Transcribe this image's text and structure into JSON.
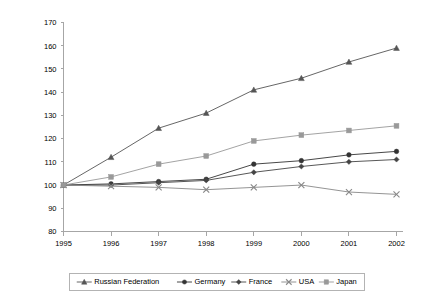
{
  "chart_data": {
    "type": "line",
    "title": "",
    "xlabel": "",
    "ylabel": "",
    "x": [
      1995,
      1996,
      1997,
      1998,
      1999,
      2000,
      2001,
      2002
    ],
    "categories": [
      "1995",
      "1996",
      "1997",
      "1998",
      "1999",
      "2000",
      "2001",
      "2002"
    ],
    "ylim": [
      80,
      170
    ],
    "yticks": [
      80,
      90,
      100,
      110,
      120,
      130,
      140,
      150,
      160,
      170
    ],
    "ytick_labels": [
      "80",
      "90",
      "100",
      "110",
      "120",
      "130",
      "140",
      "150",
      "160",
      "170"
    ],
    "grid": false,
    "legend_position": "bottom",
    "series": [
      {
        "name": "Russian Federation",
        "marker": "triangle",
        "color": "#555555",
        "values": [
          100,
          112,
          124.5,
          131,
          141,
          146,
          153,
          159
        ]
      },
      {
        "name": "Germany",
        "marker": "circle",
        "color": "#333333",
        "values": [
          100,
          100.5,
          101.5,
          102.5,
          109,
          110.5,
          113,
          114.5
        ]
      },
      {
        "name": "France",
        "marker": "diamond",
        "color": "#444444",
        "values": [
          100,
          100,
          101,
          102,
          105.5,
          108,
          110,
          111
        ]
      },
      {
        "name": "USA",
        "marker": "x",
        "color": "#888888",
        "values": [
          100,
          99.5,
          99,
          98,
          99,
          100,
          97,
          96
        ]
      },
      {
        "name": "Japan",
        "marker": "square",
        "color": "#999999",
        "values": [
          100,
          103.5,
          109,
          112.5,
          119,
          121.5,
          123.5,
          125.5
        ]
      }
    ]
  },
  "legend": {
    "items": [
      {
        "label": "Russian Federation"
      },
      {
        "label": "Germany"
      },
      {
        "label": "France"
      },
      {
        "label": "USA"
      },
      {
        "label": "Japan"
      }
    ]
  }
}
